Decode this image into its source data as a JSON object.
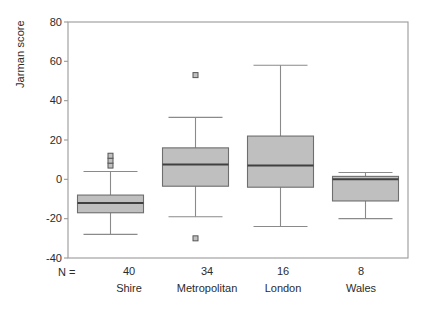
{
  "chart_data": {
    "type": "box",
    "title": "",
    "xlabel": "",
    "ylabel": "Jarman score",
    "ylim": [
      -40,
      80
    ],
    "yticks": [
      80,
      60,
      40,
      20,
      0,
      -20,
      -40
    ],
    "ytick_labels": [
      "80",
      "60",
      "40",
      "20",
      "0",
      "-20",
      "-40"
    ],
    "grid": false,
    "legend": null,
    "n_prefix": "N =",
    "categories": [
      "Shire",
      "Metropolitan",
      "London",
      "Wales"
    ],
    "n_values": [
      40,
      34,
      16,
      8
    ],
    "boxes": [
      {
        "category": "Shire",
        "n": 40,
        "whisker_low": -28,
        "q1": -17,
        "median": -12,
        "q3": -8,
        "whisker_high": 4,
        "outliers": [
          7,
          9.5,
          12
        ]
      },
      {
        "category": "Metropolitan",
        "n": 34,
        "whisker_low": -19,
        "q1": -3.5,
        "median": 7.5,
        "q3": 16,
        "whisker_high": 31.5,
        "outliers": [
          -30,
          53
        ]
      },
      {
        "category": "London",
        "n": 16,
        "whisker_low": -24,
        "q1": -4,
        "median": 7,
        "q3": 22,
        "whisker_high": 58,
        "outliers": []
      },
      {
        "category": "Wales",
        "n": 8,
        "whisker_low": -20,
        "q1": -11,
        "median": 0,
        "q3": 1.5,
        "whisker_high": 3.5,
        "outliers": []
      }
    ],
    "style": {
      "box_fill": "#bfbfbf",
      "box_stroke": "#6e6e6e",
      "median_stroke": "#404040",
      "whisker_stroke": "#8a8a8a",
      "outlier_fill": "#c0c0c0",
      "outlier_stroke": "#555555",
      "frame_stroke": "#9a9a9a",
      "text_color": "#2b2b2b"
    }
  }
}
